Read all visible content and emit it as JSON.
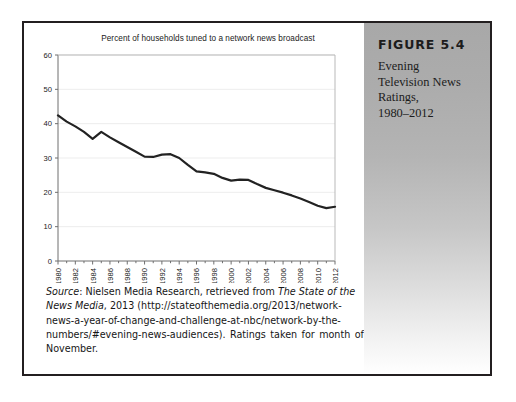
{
  "figure": {
    "number_label": "FIGURE 5.4",
    "caption_lines": [
      "Evening",
      "Television News",
      "Ratings,",
      "1980–2012"
    ]
  },
  "source": {
    "label": "Source",
    "line1_rest": ": Nielsen Media Research, retrieved from ",
    "line1_italic2": "The State of the",
    "line2_italic": "News Media",
    "line2_rest": ", 2013 (http://stateofthemedia.org/2013/network-",
    "line3": "news-a-year-of-change-and-challenge-at-nbc/network-by-the-",
    "line4_a": "numbers/#evening-news-audiences).",
    "line4_b": "Ratings",
    "line4_c": "taken",
    "line4_d": "for",
    "line4_e": "month",
    "line4_f": "of",
    "line5": "November."
  },
  "chart_data": {
    "type": "line",
    "title": "Percent of households tuned to a network news broadcast",
    "xlabel": "",
    "ylabel": "",
    "ylim": [
      0,
      60
    ],
    "yticks": [
      0,
      10,
      20,
      30,
      40,
      50,
      60
    ],
    "ytick_labels": [
      "0",
      "10",
      "20",
      "30",
      "40",
      "50",
      "60"
    ],
    "xlim": [
      1980,
      2012
    ],
    "xticks": [
      1980,
      1982,
      1984,
      1986,
      1988,
      1990,
      1992,
      1994,
      1996,
      1998,
      2000,
      2002,
      2004,
      2006,
      2008,
      2010,
      2012
    ],
    "xtick_labels": [
      "1980",
      "1982",
      "1984",
      "1986",
      "1988",
      "1990",
      "1992",
      "1994",
      "1996",
      "1998",
      "2000",
      "2002",
      "2004",
      "2006",
      "2008",
      "2010",
      "2012"
    ],
    "xtick_rotation": 90,
    "grid": "horizontal-light",
    "legend": "none",
    "line_color": "#222222",
    "line_width": 2.2,
    "x": [
      1980,
      1981,
      1982,
      1983,
      1984,
      1985,
      1986,
      1987,
      1988,
      1989,
      1990,
      1991,
      1992,
      1993,
      1994,
      1995,
      1996,
      1997,
      1998,
      1999,
      2000,
      2001,
      2002,
      2003,
      2004,
      2005,
      2006,
      2007,
      2008,
      2009,
      2010,
      2011,
      2012
    ],
    "values": [
      42.4,
      40.6,
      39.2,
      37.6,
      35.6,
      37.6,
      36.0,
      34.6,
      33.2,
      31.8,
      30.4,
      30.3,
      31.0,
      31.1,
      30.0,
      28.0,
      26.1,
      25.8,
      25.4,
      24.2,
      23.4,
      23.7,
      23.6,
      22.4,
      21.3,
      20.6,
      19.9,
      19.1,
      18.2,
      17.2,
      16.1,
      15.4,
      15.8
    ],
    "series_name": "Percent of households"
  }
}
